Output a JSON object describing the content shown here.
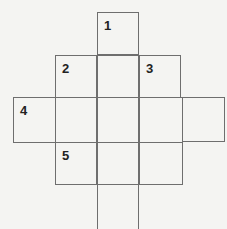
{
  "puzzle": {
    "type": "crossword-grid",
    "cells": [
      {
        "row": 0,
        "col": 2,
        "number": "1"
      },
      {
        "row": 1,
        "col": 1,
        "number": "2"
      },
      {
        "row": 1,
        "col": 2,
        "number": ""
      },
      {
        "row": 1,
        "col": 3,
        "number": "3"
      },
      {
        "row": 2,
        "col": 0,
        "number": "4"
      },
      {
        "row": 2,
        "col": 1,
        "number": ""
      },
      {
        "row": 2,
        "col": 2,
        "number": ""
      },
      {
        "row": 2,
        "col": 3,
        "number": ""
      },
      {
        "row": 2,
        "col": 4,
        "number": ""
      },
      {
        "row": 3,
        "col": 1,
        "number": "5"
      },
      {
        "row": 3,
        "col": 2,
        "number": ""
      },
      {
        "row": 3,
        "col": 3,
        "number": ""
      },
      {
        "row": 4,
        "col": 2,
        "number": ""
      }
    ],
    "colors": {
      "line": "#6e6e6e",
      "number": "#222222",
      "background": "#f4f4f2"
    }
  }
}
